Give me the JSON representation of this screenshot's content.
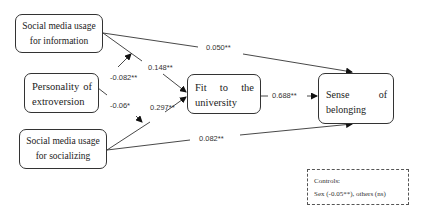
{
  "nodes": {
    "sm_information": {
      "line1": "Social media usage",
      "line2": "for information"
    },
    "extroversion": {
      "line1_words": [
        "Personality",
        "of"
      ],
      "line2": "extroversion"
    },
    "sm_socializing": {
      "line1": "Social media usage",
      "line2": "for socializing"
    },
    "fit_university": {
      "line1_words": [
        "Fit",
        "to",
        "the"
      ],
      "line2": "university"
    },
    "sense_belonging": {
      "line1_words": [
        "Sense",
        "of"
      ],
      "line2": "belonging"
    }
  },
  "paths": [
    {
      "from": "sm_information",
      "to": "sense_belonging",
      "coef": "0.050**"
    },
    {
      "from": "sm_information",
      "to": "fit_university",
      "coef": "0.148**"
    },
    {
      "from": "extroversion",
      "to": "path_sm_information_fit",
      "coef": "-0.082**",
      "type": "moderation"
    },
    {
      "from": "extroversion",
      "to": "path_sm_socializing_fit",
      "coef": "-0.06*",
      "type": "moderation"
    },
    {
      "from": "sm_socializing",
      "to": "fit_university",
      "coef": "0.297**"
    },
    {
      "from": "fit_university",
      "to": "sense_belonging",
      "coef": "0.688**"
    },
    {
      "from": "sm_socializing",
      "to": "sense_belonging",
      "coef": "0.082**"
    }
  ],
  "controls": {
    "title": "Controls:",
    "text": "Sex (-0.05**), others (ns)"
  }
}
